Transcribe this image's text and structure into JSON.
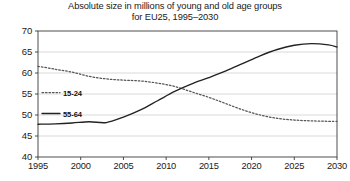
{
  "chart_data": {
    "type": "line",
    "title": "Absolute size in millions of young and old age groups for EU25, 1995–2030",
    "title_line1": "Absolute size in millions of young and old age groups",
    "title_line2": "for EU25, 1995–2030",
    "xlabel": "",
    "ylabel": "",
    "xlim": [
      1995,
      2030
    ],
    "ylim": [
      40,
      70
    ],
    "yticks": [
      40,
      45,
      50,
      55,
      60,
      65,
      70
    ],
    "xticks": [
      1995,
      2000,
      2005,
      2010,
      2015,
      2020,
      2025,
      2030
    ],
    "ytick_labels": [
      "40",
      "45",
      "50",
      "55",
      "60",
      "65",
      "70"
    ],
    "xtick_labels": [
      "1995",
      "2000",
      "2005",
      "2010",
      "2015",
      "2020",
      "2025",
      "2030"
    ],
    "grid": true,
    "grid_axis": "y",
    "legend_position": "inside-left",
    "x": [
      1995,
      1997,
      1999,
      2001,
      2003,
      2005,
      2007,
      2009,
      2011,
      2013,
      2015,
      2017,
      2019,
      2021,
      2023,
      2025,
      2027,
      2029,
      2030
    ],
    "series": [
      {
        "name": "15-24",
        "style": "dotted",
        "color": "#555555",
        "values": [
          61.6,
          60.9,
          60.2,
          59.2,
          58.6,
          58.3,
          58.1,
          57.6,
          56.8,
          55.5,
          54.2,
          52.7,
          51.2,
          50.0,
          49.2,
          48.8,
          48.6,
          48.5,
          48.5
        ]
      },
      {
        "name": "55-64",
        "style": "solid",
        "color": "#222222",
        "values": [
          47.8,
          47.9,
          48.1,
          48.4,
          48.2,
          49.5,
          51.2,
          53.4,
          55.6,
          57.4,
          58.9,
          60.5,
          62.3,
          64.1,
          65.6,
          66.6,
          67.0,
          66.7,
          66.2
        ]
      }
    ],
    "legend": [
      {
        "label": "15-24",
        "style": "dotted"
      },
      {
        "label": "55-64",
        "style": "solid"
      }
    ],
    "colors": {
      "axis": "#3a3a3a",
      "grid": "#c9c9c9",
      "series_young": "#555555",
      "series_old": "#222222",
      "background": "#ffffff"
    }
  }
}
